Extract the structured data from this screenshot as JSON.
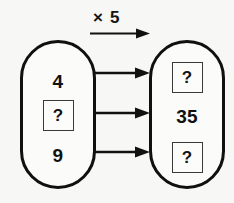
{
  "diagram": {
    "type": "mapping-diagram",
    "operation_label": "× 5",
    "background_color": "#f7f7f6",
    "stroke_color": "#111111",
    "left_set": {
      "name": "input-set",
      "items": [
        {
          "kind": "number",
          "value": "4"
        },
        {
          "kind": "boxed-unknown",
          "value": "?"
        },
        {
          "kind": "number",
          "value": "9"
        }
      ]
    },
    "right_set": {
      "name": "output-set",
      "items": [
        {
          "kind": "boxed-unknown",
          "value": "?"
        },
        {
          "kind": "number",
          "value": "35"
        },
        {
          "kind": "boxed-unknown",
          "value": "?"
        }
      ]
    },
    "mappings": [
      {
        "from": "4",
        "to": "?"
      },
      {
        "from": "?",
        "to": "35"
      },
      {
        "from": "9",
        "to": "?"
      }
    ],
    "arrow_count": 3
  }
}
